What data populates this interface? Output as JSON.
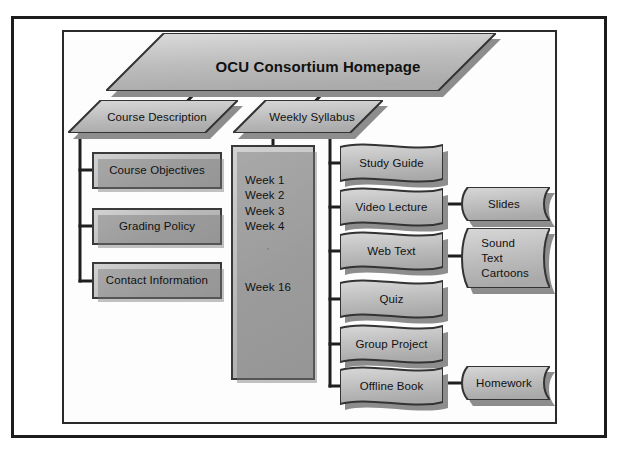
{
  "diagram": {
    "title": "OCU Consortium Homepage",
    "type": "hierarchy-org-chart",
    "level2": [
      {
        "label": "Course Description"
      },
      {
        "label": "Weekly Syllabus"
      }
    ],
    "course_description_children": [
      {
        "label": "Course Objectives"
      },
      {
        "label": "Grading Policy"
      },
      {
        "label": "Contact Information"
      }
    ],
    "weeks_box": {
      "weeks": "Week 1\nWeek 2\nWeek 3\nWeek 4",
      "last_week": "Week 16"
    },
    "weekly_content": [
      {
        "label": "Study Guide"
      },
      {
        "label": "Video Lecture"
      },
      {
        "label": "Web Text"
      },
      {
        "label": "Quiz"
      },
      {
        "label": "Group Project"
      },
      {
        "label": "Offline Book"
      }
    ],
    "sub_content": [
      {
        "label": "Slides"
      },
      {
        "label": "Sound\nText\nCartoons"
      },
      {
        "label": "Homework"
      }
    ],
    "colors": {
      "node_fill_light": "#d2d2d2",
      "node_fill_dark": "#aeaeae",
      "node_border": "#3a3a3a",
      "shadow": "#8d8d8d",
      "line": "#1e1e1e",
      "frame": "#1c1c1c",
      "text": "#111111",
      "background": "#ffffff"
    }
  }
}
